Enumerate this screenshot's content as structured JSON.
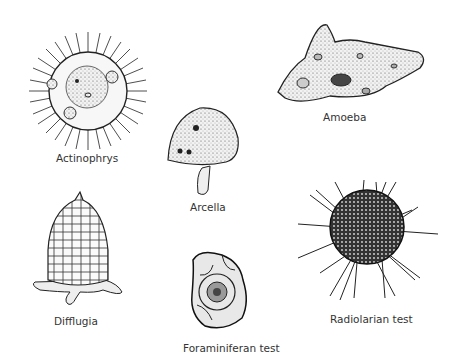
{
  "figure": {
    "organisms": [
      {
        "name": "actinophrys",
        "label": "Actinophrys"
      },
      {
        "name": "arcella",
        "label": "Arcella"
      },
      {
        "name": "amoeba",
        "label": "Amoeba"
      },
      {
        "name": "difflugia",
        "label": "Difflugia"
      },
      {
        "name": "foraminiferan-test",
        "label": "Foraminiferan test"
      },
      {
        "name": "radiolarian-test",
        "label": "Radiolarian test"
      }
    ]
  }
}
